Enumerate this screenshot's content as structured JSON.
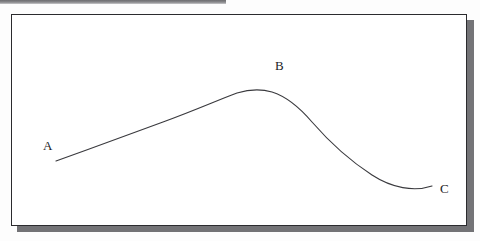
{
  "document": {
    "kind": "scanned-line-diagram",
    "caption": ""
  },
  "frame": {
    "border_color": "#2b2b2e",
    "fill_color": "#ffffff",
    "shadow_color": "#737376",
    "x": 11,
    "y": 14,
    "width": 456,
    "height": 212
  },
  "scan_band": {
    "color": "#6d6d70",
    "x": 0,
    "y": 0,
    "width": 226,
    "height": 4
  },
  "curve": {
    "name": "hill-curve",
    "stroke_color": "#3a3a3e",
    "stroke_width": 1.15,
    "path": "M 56 161 C 92 148 130 134 163 122 C 196 110 218 100 237 93 C 250 89 262 89 272 92 C 288 97 300 108 312 122 C 332 145 352 162 372 175 C 392 188 414 192 432 186"
  },
  "labels": {
    "a": "A",
    "b": "B",
    "c": "C"
  },
  "chart_data": {
    "type": "line",
    "title": "",
    "xlabel": "",
    "ylabel": "",
    "grid": false,
    "legend": null,
    "annotations": [
      {
        "text": "A",
        "role": "start-point",
        "x": 44,
        "y": 146
      },
      {
        "text": "B",
        "role": "peak-point",
        "x": 276,
        "y": 66
      },
      {
        "text": "C",
        "role": "end-point",
        "x": 441,
        "y": 189
      }
    ],
    "points": [
      {
        "label": "A",
        "x": 56,
        "y": 161
      },
      {
        "x": 120,
        "y": 138
      },
      {
        "x": 163,
        "y": 122
      },
      {
        "x": 200,
        "y": 106
      },
      {
        "label": "B",
        "x": 252,
        "y": 91
      },
      {
        "x": 300,
        "y": 107
      },
      {
        "x": 340,
        "y": 150
      },
      {
        "x": 390,
        "y": 178
      },
      {
        "label": "C",
        "x": 432,
        "y": 186
      }
    ]
  }
}
